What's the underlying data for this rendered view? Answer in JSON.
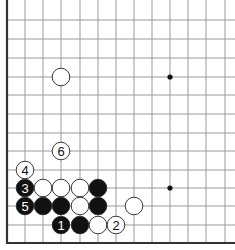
{
  "diagram": {
    "board": {
      "columns_x": [
        7,
        25,
        43,
        61,
        80,
        98,
        116,
        134,
        152,
        170,
        188,
        206,
        225
      ],
      "rows_y": [
        20,
        39,
        58,
        77,
        95,
        114,
        133,
        151,
        170,
        188,
        206,
        225,
        243
      ],
      "left_edge": true,
      "bottom_edge": true,
      "line_color": "#999999",
      "edge_color": "#333333"
    },
    "star_points": [
      {
        "col": 9,
        "row": 3
      },
      {
        "col": 9,
        "row": 9
      }
    ],
    "stones": [
      {
        "color": "white",
        "col": 3,
        "row": 3,
        "label": ""
      },
      {
        "color": "white",
        "col": 3,
        "row": 7,
        "label": "6"
      },
      {
        "color": "white",
        "col": 1,
        "row": 8,
        "label": "4"
      },
      {
        "color": "black",
        "col": 1,
        "row": 9,
        "label": "3"
      },
      {
        "color": "white",
        "col": 2,
        "row": 9,
        "label": ""
      },
      {
        "color": "white",
        "col": 3,
        "row": 9,
        "label": ""
      },
      {
        "color": "white",
        "col": 4,
        "row": 9,
        "label": ""
      },
      {
        "color": "black",
        "col": 5,
        "row": 9,
        "label": ""
      },
      {
        "color": "black",
        "col": 1,
        "row": 10,
        "label": "5"
      },
      {
        "color": "black",
        "col": 2,
        "row": 10,
        "label": ""
      },
      {
        "color": "black",
        "col": 3,
        "row": 10,
        "label": ""
      },
      {
        "color": "white",
        "col": 4,
        "row": 10,
        "label": ""
      },
      {
        "color": "black",
        "col": 5,
        "row": 10,
        "label": ""
      },
      {
        "color": "white",
        "col": 7,
        "row": 10,
        "label": ""
      },
      {
        "color": "black",
        "col": 3,
        "row": 11,
        "label": "1"
      },
      {
        "color": "black",
        "col": 4,
        "row": 11,
        "label": ""
      },
      {
        "color": "white",
        "col": 5,
        "row": 11,
        "label": ""
      },
      {
        "color": "white",
        "col": 6,
        "row": 11,
        "label": "2"
      }
    ]
  }
}
